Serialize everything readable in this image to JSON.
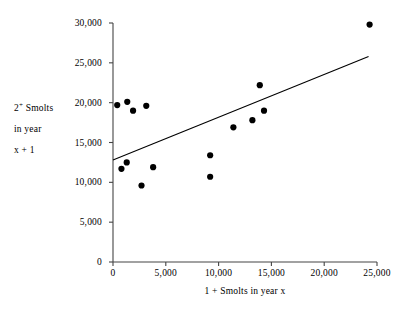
{
  "chart_data": {
    "type": "scatter",
    "title": "",
    "xlabel": "1 + Smolts in year x",
    "ylabel_lines": [
      "2+ Smolts",
      "in year",
      "x + 1"
    ],
    "ylabel": "2+ Smolts in year x + 1",
    "xlim": [
      0,
      25000
    ],
    "ylim": [
      0,
      30000
    ],
    "xticks": [
      0,
      5000,
      10000,
      15000,
      20000,
      25000
    ],
    "yticks": [
      0,
      5000,
      10000,
      15000,
      20000,
      25000,
      30000
    ],
    "xticklabels": [
      "0",
      "5,000",
      "10,000",
      "15,000",
      "20,000",
      "25,000"
    ],
    "yticklabels": [
      "0",
      "5,000",
      "10,000",
      "15,000",
      "20,000",
      "25,000",
      "30,000"
    ],
    "grid": false,
    "legend": false,
    "marker": "filled-circle",
    "marker_color": "#000000",
    "line_color": "#000000",
    "points": [
      {
        "x": 400,
        "y": 19700
      },
      {
        "x": 1350,
        "y": 20100
      },
      {
        "x": 1900,
        "y": 19000
      },
      {
        "x": 3150,
        "y": 19600
      },
      {
        "x": 800,
        "y": 11700
      },
      {
        "x": 1300,
        "y": 12500
      },
      {
        "x": 2700,
        "y": 9600
      },
      {
        "x": 3800,
        "y": 11900
      },
      {
        "x": 9200,
        "y": 13400
      },
      {
        "x": 9200,
        "y": 10700
      },
      {
        "x": 11400,
        "y": 16900
      },
      {
        "x": 13200,
        "y": 17800
      },
      {
        "x": 13900,
        "y": 22200
      },
      {
        "x": 14300,
        "y": 19000
      },
      {
        "x": 24300,
        "y": 29800
      }
    ],
    "trendline": {
      "x_start": 0,
      "y_start": 12800,
      "x_end": 24200,
      "y_end": 25800
    },
    "series_name": "Smolt counts"
  },
  "axes": {
    "y_title_line1": "2",
    "y_title_sup": "+",
    "y_title_line1_rest": " Smolts",
    "y_title_line2": "in year",
    "y_title_line3": "x + 1",
    "x_title": "1 + Smolts in year x"
  }
}
